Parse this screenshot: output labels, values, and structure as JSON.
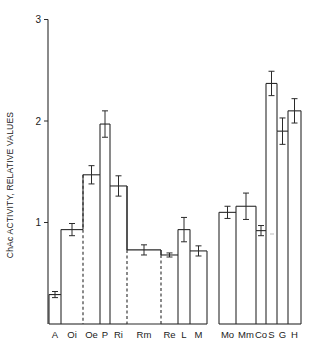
{
  "chart_data": {
    "type": "bar",
    "title": "",
    "xlabel": "",
    "ylabel": "ChAc ACTIVITY, RELATIVE VALUES",
    "ylim": [
      0,
      3
    ],
    "yticks": [
      1,
      2,
      3
    ],
    "grid": false,
    "legend": null,
    "categories": [
      "A",
      "Oi",
      "Oe",
      "P",
      "Ri",
      "Rm",
      "Re",
      "L",
      "M",
      "Mo",
      "Mm",
      "Co",
      "S",
      "G",
      "H"
    ],
    "values": [
      0.29,
      0.93,
      1.47,
      1.97,
      1.36,
      0.73,
      0.68,
      0.93,
      0.72,
      1.1,
      1.16,
      0.92,
      2.37,
      1.9,
      2.1
    ],
    "errors": [
      0.03,
      0.06,
      0.09,
      0.13,
      0.1,
      0.05,
      0.02,
      0.12,
      0.05,
      0.06,
      0.13,
      0.05,
      0.12,
      0.13,
      0.12
    ],
    "groups": [
      {
        "members": [
          "A",
          "Oi",
          "Oe",
          "P",
          "Ri",
          "Rm",
          "Re",
          "L",
          "M"
        ]
      },
      {
        "members": [
          "Mo",
          "Mm",
          "Co",
          "S",
          "G",
          "H"
        ]
      }
    ],
    "dashed_separators_after": [
      "Oi",
      "Ri",
      "Rm"
    ]
  },
  "layout": {
    "bars": [
      {
        "label": "A",
        "x0": 49,
        "x1": 61
      },
      {
        "label": "Oi",
        "x0": 61,
        "x1": 83
      },
      {
        "label": "Oe",
        "x0": 83,
        "x1": 100
      },
      {
        "label": "P",
        "x0": 100,
        "x1": 110
      },
      {
        "label": "Ri",
        "x0": 110,
        "x1": 127
      },
      {
        "label": "Rm",
        "x0": 127,
        "x1": 161
      },
      {
        "label": "Re",
        "x0": 161,
        "x1": 178
      },
      {
        "label": "L",
        "x0": 178,
        "x1": 190
      },
      {
        "label": "M",
        "x0": 190,
        "x1": 207
      },
      {
        "label": "Mo",
        "x0": 219,
        "x1": 236
      },
      {
        "label": "Mm",
        "x0": 236,
        "x1": 256
      },
      {
        "label": "Co",
        "x0": 256,
        "x1": 266
      },
      {
        "label": "S",
        "x0": 266,
        "x1": 277
      },
      {
        "label": "G",
        "x0": 277,
        "x1": 288
      },
      {
        "label": "H",
        "x0": 288,
        "x1": 301
      }
    ]
  }
}
